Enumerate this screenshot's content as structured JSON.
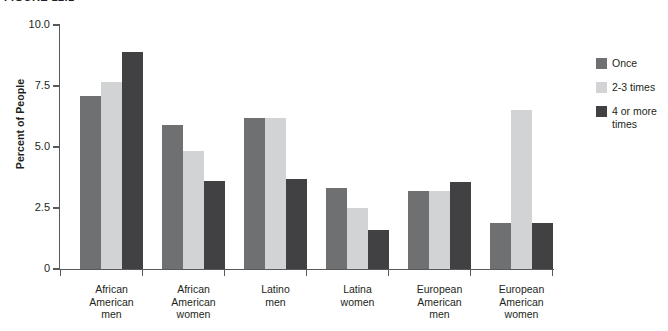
{
  "figure": {
    "caption": "FIGURE 12.1"
  },
  "chart_data": {
    "type": "bar",
    "title": "",
    "xlabel": "",
    "ylabel": "Percent of People",
    "ylim": [
      0,
      10
    ],
    "yticks": [
      "0",
      "2.5",
      "5.0",
      "7.5",
      "10.0"
    ],
    "ytick_values": [
      0,
      2.5,
      5,
      7.5,
      10
    ],
    "grid": false,
    "legend_position": "right",
    "categories": [
      "African American men",
      "African American women",
      "Latino men",
      "Latina women",
      "European American men",
      "European American women"
    ],
    "category_lines": [
      [
        "African",
        "American",
        "men"
      ],
      [
        "African",
        "American",
        "women"
      ],
      [
        "Latino",
        "men"
      ],
      [
        "Latina",
        "women"
      ],
      [
        "European",
        "American",
        "men"
      ],
      [
        "European",
        "American",
        "women"
      ]
    ],
    "series": [
      {
        "name": "Once",
        "color": "#6f7072",
        "values": [
          7.1,
          5.9,
          6.2,
          3.3,
          3.2,
          1.9
        ]
      },
      {
        "name": "2-3 times",
        "color": "#d2d3d4",
        "values": [
          7.65,
          4.85,
          6.2,
          2.5,
          3.2,
          6.5
        ]
      },
      {
        "name": "4 or more times",
        "color": "#414042",
        "values": [
          8.9,
          3.6,
          3.7,
          1.6,
          3.55,
          1.9
        ]
      }
    ]
  },
  "legend": {
    "items": [
      {
        "label": "Once"
      },
      {
        "label": "2-3 times"
      },
      {
        "label": "4 or more times"
      }
    ]
  }
}
